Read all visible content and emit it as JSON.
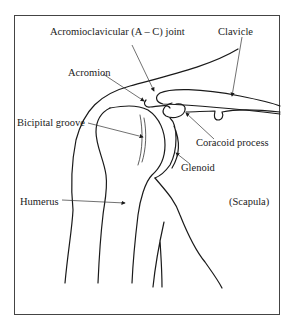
{
  "diagram": {
    "labels": {
      "ac_joint": "Acromioclavicular (A – C) joint",
      "clavicle": "Clavicle",
      "acromion": "Acromion",
      "bicipital_groove": "Bicipital groove",
      "coracoid_process": "Coracoid process",
      "glenoid": "Glenoid",
      "humerus": "Humerus",
      "scapula": "(Scapula)"
    },
    "colors": {
      "line": "#1a1a1a",
      "text": "#222222",
      "background": "#ffffff",
      "frame": "#444444"
    }
  }
}
